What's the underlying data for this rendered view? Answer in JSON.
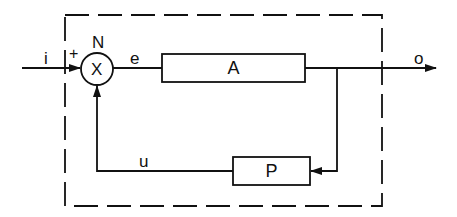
{
  "diagram": {
    "type": "feedback-control-block-diagram",
    "boundary": {
      "style": "dashed"
    },
    "summing_junction": {
      "label": "N",
      "symbol": "X",
      "input_sign": "+"
    },
    "blocks": [
      {
        "id": "forward",
        "label": "A"
      },
      {
        "id": "feedback",
        "label": "P"
      }
    ],
    "signals": {
      "input": "i",
      "error": "e",
      "output": "o",
      "feedback": "u"
    },
    "connections": [
      {
        "from": "i",
        "to": "N"
      },
      {
        "from": "N",
        "to": "A",
        "signal": "e"
      },
      {
        "from": "A",
        "to": "o"
      },
      {
        "from": "o",
        "to": "P"
      },
      {
        "from": "P",
        "to": "N",
        "signal": "u"
      }
    ],
    "colors": {
      "stroke": "#111111",
      "background": "#ffffff"
    }
  }
}
